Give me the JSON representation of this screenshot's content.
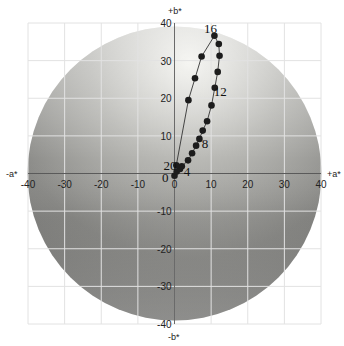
{
  "chart_data": {
    "type": "scatter",
    "title": "",
    "xlabel_pos": "+a*",
    "xlabel_neg": "-a*",
    "ylabel_pos": "+b*",
    "ylabel_neg": "-b*",
    "xlim": [
      -40,
      40
    ],
    "ylim": [
      -40,
      40
    ],
    "grid": true,
    "x_ticks": [
      -40,
      -30,
      -20,
      -10,
      0,
      10,
      20,
      30,
      40
    ],
    "y_ticks": [
      -40,
      -30,
      -20,
      -10,
      0,
      10,
      20,
      30,
      40
    ],
    "series": [
      {
        "name": "a*b* trajectory",
        "connected": true,
        "points": [
          {
            "a": 0.0,
            "b": -0.6
          },
          {
            "a": 0.6,
            "b": 0.5
          },
          {
            "a": 1.5,
            "b": 1.2
          },
          {
            "a": 2.0,
            "b": 1.9
          },
          {
            "a": 3.7,
            "b": 3.5
          },
          {
            "a": 4.8,
            "b": 5.4
          },
          {
            "a": 5.9,
            "b": 7.4
          },
          {
            "a": 6.8,
            "b": 9.2
          },
          {
            "a": 7.7,
            "b": 11.4
          },
          {
            "a": 8.9,
            "b": 13.9
          },
          {
            "a": 10.1,
            "b": 18.1
          },
          {
            "a": 11.0,
            "b": 22.8
          },
          {
            "a": 11.8,
            "b": 27.0
          },
          {
            "a": 12.3,
            "b": 31.3
          },
          {
            "a": 12.1,
            "b": 34.4
          },
          {
            "a": 10.9,
            "b": 36.6
          },
          {
            "a": 7.4,
            "b": 31.1
          },
          {
            "a": 5.6,
            "b": 25.3
          },
          {
            "a": 3.8,
            "b": 19.5
          },
          {
            "a": 0.5,
            "b": 2.2
          }
        ]
      }
    ],
    "annotations": [
      {
        "text": "0",
        "a": -2.5,
        "b": -0.8
      },
      {
        "text": "4",
        "a": 3.4,
        "b": 0.6
      },
      {
        "text": "8",
        "a": 8.3,
        "b": 8.0
      },
      {
        "text": "12",
        "a": 12.5,
        "b": 21.8
      },
      {
        "text": "16",
        "a": 9.8,
        "b": 38.8
      },
      {
        "text": "20",
        "a": -1.2,
        "b": 2.3
      }
    ]
  },
  "axes": {
    "plus_a": "+a*",
    "minus_a": "-a*",
    "plus_b": "+b*",
    "minus_b": "-b*"
  }
}
